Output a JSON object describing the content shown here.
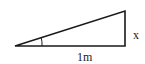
{
  "diagram": {
    "type": "right-triangle",
    "labels": {
      "vertical_side": "x",
      "base": "1m"
    },
    "vertices": {
      "left": [
        15,
        46
      ],
      "right_angle": [
        125,
        46
      ],
      "top": [
        125,
        11
      ]
    },
    "angle_marker": "arc at left vertex",
    "stroke_color": "#1a1a1a",
    "background": "#ffffff"
  }
}
